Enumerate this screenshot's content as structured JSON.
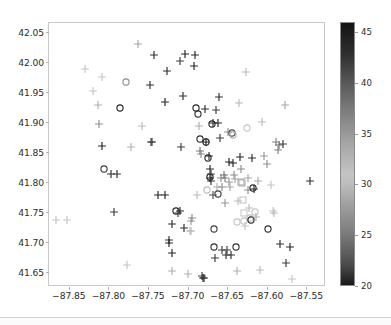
{
  "chart_data": {
    "type": "scatter",
    "title": "",
    "xlabel": "",
    "ylabel": "",
    "xlim": [
      -87.875,
      -87.525
    ],
    "ylim": [
      41.625,
      42.065
    ],
    "xticks": [
      -87.85,
      -87.8,
      -87.75,
      -87.7,
      -87.65,
      -87.6,
      -87.55
    ],
    "xticklabels": [
      "−87.85",
      "−87.80",
      "−87.75",
      "−87.70",
      "−87.65",
      "−87.60",
      "−87.55"
    ],
    "yticks": [
      41.65,
      41.7,
      41.75,
      41.8,
      41.85,
      41.9,
      41.95,
      42.0,
      42.05
    ],
    "yticklabels": [
      "41.65",
      "41.70",
      "41.75",
      "41.80",
      "41.85",
      "41.90",
      "41.95",
      "42.00",
      "42.05"
    ],
    "grid": false,
    "legend": null,
    "colorbar": {
      "position": "right",
      "orientation": "vertical",
      "vmin": 20,
      "vmax": 46,
      "ticks": [
        20,
        25,
        30,
        35,
        40,
        45
      ],
      "ticklabels": [
        "20",
        "25",
        "30",
        "35",
        "40",
        "45"
      ],
      "colormap": "gray-dark-light-dark",
      "stops": [
        {
          "value": 46,
          "color": "#141414"
        },
        {
          "value": 43,
          "color": "#2e2e2e"
        },
        {
          "value": 40,
          "color": "#595959"
        },
        {
          "value": 37,
          "color": "#808080"
        },
        {
          "value": 34,
          "color": "#a6a6a6"
        },
        {
          "value": 31,
          "color": "#c4c4c4"
        },
        {
          "value": 30,
          "color": "#bdbdbd"
        },
        {
          "value": 28,
          "color": "#a0a0a0"
        },
        {
          "value": 25,
          "color": "#7a7a7a"
        },
        {
          "value": 22,
          "color": "#4a4a4a"
        },
        {
          "value": 20,
          "color": "#1a1a1a"
        }
      ]
    },
    "markers": [
      "plus",
      "circle",
      "square"
    ],
    "points": [
      {
        "x": -87.866,
        "y": 41.737,
        "c": 31,
        "m": "plus"
      },
      {
        "x": -87.852,
        "y": 41.736,
        "c": 31,
        "m": "plus"
      },
      {
        "x": -87.83,
        "y": 41.988,
        "c": 31,
        "m": "plus"
      },
      {
        "x": -87.82,
        "y": 41.951,
        "c": 31,
        "m": "plus"
      },
      {
        "x": -87.813,
        "y": 41.929,
        "c": 33,
        "m": "plus"
      },
      {
        "x": -87.812,
        "y": 41.897,
        "c": 36,
        "m": "plus"
      },
      {
        "x": -87.808,
        "y": 41.975,
        "c": 31,
        "m": "plus"
      },
      {
        "x": -87.808,
        "y": 41.86,
        "c": 44,
        "m": "plus"
      },
      {
        "x": -87.806,
        "y": 41.821,
        "c": 42,
        "m": "circle"
      },
      {
        "x": -87.797,
        "y": 41.813,
        "c": 43,
        "m": "plus"
      },
      {
        "x": -87.793,
        "y": 41.75,
        "c": 42,
        "m": "plus"
      },
      {
        "x": -87.789,
        "y": 41.814,
        "c": 43,
        "m": "plus"
      },
      {
        "x": -87.785,
        "y": 41.924,
        "c": 44,
        "m": "circle"
      },
      {
        "x": -87.778,
        "y": 41.967,
        "c": 36,
        "m": "circle"
      },
      {
        "x": -87.777,
        "y": 41.662,
        "c": 31,
        "m": "plus"
      },
      {
        "x": -87.771,
        "y": 41.858,
        "c": 33,
        "m": "plus"
      },
      {
        "x": -87.762,
        "y": 42.03,
        "c": 34,
        "m": "plus"
      },
      {
        "x": -87.757,
        "y": 41.894,
        "c": 32,
        "m": "plus"
      },
      {
        "x": -87.748,
        "y": 41.961,
        "c": 43,
        "m": "plus"
      },
      {
        "x": -87.746,
        "y": 41.867,
        "c": 42,
        "m": "plus"
      },
      {
        "x": -87.745,
        "y": 41.866,
        "c": 42,
        "m": "plus"
      },
      {
        "x": -87.742,
        "y": 42.011,
        "c": 43,
        "m": "plus"
      },
      {
        "x": -87.737,
        "y": 41.778,
        "c": 44,
        "m": "plus"
      },
      {
        "x": -87.729,
        "y": 41.778,
        "c": 44,
        "m": "plus"
      },
      {
        "x": -87.728,
        "y": 41.934,
        "c": 44,
        "m": "plus"
      },
      {
        "x": -87.726,
        "y": 41.985,
        "c": 43,
        "m": "plus"
      },
      {
        "x": -87.724,
        "y": 41.704,
        "c": 43,
        "m": "plus"
      },
      {
        "x": -87.723,
        "y": 41.698,
        "c": 44,
        "m": "plus"
      },
      {
        "x": -87.72,
        "y": 41.73,
        "c": 43,
        "m": "plus"
      },
      {
        "x": -87.719,
        "y": 41.681,
        "c": 44,
        "m": "plus"
      },
      {
        "x": -87.719,
        "y": 41.651,
        "c": 33,
        "m": "plus"
      },
      {
        "x": -87.715,
        "y": 41.751,
        "c": 44,
        "m": "circle"
      },
      {
        "x": -87.712,
        "y": 41.748,
        "c": 42,
        "m": "plus"
      },
      {
        "x": -87.71,
        "y": 42.002,
        "c": 42,
        "m": "plus"
      },
      {
        "x": -87.709,
        "y": 41.751,
        "c": 44,
        "m": "plus"
      },
      {
        "x": -87.708,
        "y": 41.859,
        "c": 42,
        "m": "plus"
      },
      {
        "x": -87.706,
        "y": 41.944,
        "c": 43,
        "m": "plus"
      },
      {
        "x": -87.704,
        "y": 41.723,
        "c": 43,
        "m": "plus"
      },
      {
        "x": -87.703,
        "y": 42.013,
        "c": 44,
        "m": "plus"
      },
      {
        "x": -87.7,
        "y": 41.646,
        "c": 33,
        "m": "plus"
      },
      {
        "x": -87.697,
        "y": 41.719,
        "c": 32,
        "m": "plus"
      },
      {
        "x": -87.696,
        "y": 41.735,
        "c": 35,
        "m": "plus"
      },
      {
        "x": -87.695,
        "y": 41.719,
        "c": 32,
        "m": "plus"
      },
      {
        "x": -87.694,
        "y": 41.74,
        "c": 36,
        "m": "plus"
      },
      {
        "x": -87.692,
        "y": 41.993,
        "c": 44,
        "m": "plus"
      },
      {
        "x": -87.69,
        "y": 42.012,
        "c": 44,
        "m": "plus"
      },
      {
        "x": -87.689,
        "y": 41.924,
        "c": 44,
        "m": "circle"
      },
      {
        "x": -87.688,
        "y": 41.778,
        "c": 32,
        "m": "plus"
      },
      {
        "x": -87.687,
        "y": 41.913,
        "c": 43,
        "m": "circle"
      },
      {
        "x": -87.686,
        "y": 41.894,
        "c": 33,
        "m": "plus"
      },
      {
        "x": -87.684,
        "y": 41.871,
        "c": 43,
        "m": "circle"
      },
      {
        "x": -87.684,
        "y": 41.851,
        "c": 38,
        "m": "plus"
      },
      {
        "x": -87.683,
        "y": 41.847,
        "c": 36,
        "m": "plus"
      },
      {
        "x": -87.682,
        "y": 41.643,
        "c": 42,
        "m": "plus"
      },
      {
        "x": -87.68,
        "y": 41.64,
        "c": 43,
        "m": "plus"
      },
      {
        "x": -87.679,
        "y": 41.64,
        "c": 43,
        "m": "plus"
      },
      {
        "x": -87.678,
        "y": 41.922,
        "c": 43,
        "m": "plus"
      },
      {
        "x": -87.677,
        "y": 41.867,
        "c": 44,
        "m": "circle"
      },
      {
        "x": -87.676,
        "y": 41.866,
        "c": 44,
        "m": "plus"
      },
      {
        "x": -87.675,
        "y": 41.787,
        "c": 32,
        "m": "circle"
      },
      {
        "x": -87.674,
        "y": 41.84,
        "c": 44,
        "m": "circle"
      },
      {
        "x": -87.673,
        "y": 41.843,
        "c": 43,
        "m": "plus"
      },
      {
        "x": -87.672,
        "y": 41.822,
        "c": 44,
        "m": "plus"
      },
      {
        "x": -87.671,
        "y": 41.808,
        "c": 44,
        "m": "circle"
      },
      {
        "x": -87.671,
        "y": 41.806,
        "c": 44,
        "m": "plus"
      },
      {
        "x": -87.67,
        "y": 41.814,
        "c": 42,
        "m": "plus"
      },
      {
        "x": -87.67,
        "y": 41.801,
        "c": 43,
        "m": "plus"
      },
      {
        "x": -87.669,
        "y": 41.897,
        "c": 44,
        "m": "circle"
      },
      {
        "x": -87.668,
        "y": 41.899,
        "c": 43,
        "m": "plus"
      },
      {
        "x": -87.668,
        "y": 41.779,
        "c": 41,
        "m": "plus"
      },
      {
        "x": -87.667,
        "y": 41.721,
        "c": 42,
        "m": "circle"
      },
      {
        "x": -87.666,
        "y": 41.692,
        "c": 43,
        "m": "circle"
      },
      {
        "x": -87.665,
        "y": 41.674,
        "c": 42,
        "m": "plus"
      },
      {
        "x": -87.664,
        "y": 41.92,
        "c": 42,
        "m": "plus"
      },
      {
        "x": -87.663,
        "y": 41.791,
        "c": 33,
        "m": "plus"
      },
      {
        "x": -87.662,
        "y": 41.78,
        "c": 42,
        "m": "circle"
      },
      {
        "x": -87.661,
        "y": 41.899,
        "c": 44,
        "m": "plus"
      },
      {
        "x": -87.66,
        "y": 41.941,
        "c": 43,
        "m": "plus"
      },
      {
        "x": -87.659,
        "y": 41.873,
        "c": 42,
        "m": "plus"
      },
      {
        "x": -87.658,
        "y": 41.806,
        "c": 36,
        "m": "plus"
      },
      {
        "x": -87.657,
        "y": 41.792,
        "c": 36,
        "m": "plus"
      },
      {
        "x": -87.656,
        "y": 41.686,
        "c": 42,
        "m": "plus"
      },
      {
        "x": -87.654,
        "y": 41.812,
        "c": 38,
        "m": "plus"
      },
      {
        "x": -87.653,
        "y": 41.765,
        "c": 35,
        "m": "plus"
      },
      {
        "x": -87.652,
        "y": 41.806,
        "c": 37,
        "m": "plus"
      },
      {
        "x": -87.651,
        "y": 41.679,
        "c": 43,
        "m": "plus"
      },
      {
        "x": -87.65,
        "y": 41.687,
        "c": 42,
        "m": "plus"
      },
      {
        "x": -87.649,
        "y": 41.884,
        "c": 36,
        "m": "plus"
      },
      {
        "x": -87.648,
        "y": 41.8,
        "c": 35,
        "m": "plus"
      },
      {
        "x": -87.647,
        "y": 41.834,
        "c": 44,
        "m": "plus"
      },
      {
        "x": -87.646,
        "y": 41.791,
        "c": 34,
        "m": "plus"
      },
      {
        "x": -87.645,
        "y": 41.678,
        "c": 43,
        "m": "plus"
      },
      {
        "x": -87.644,
        "y": 41.882,
        "c": 41,
        "m": "circle"
      },
      {
        "x": -87.643,
        "y": 41.878,
        "c": 33,
        "m": "circle"
      },
      {
        "x": -87.642,
        "y": 41.831,
        "c": 44,
        "m": "plus"
      },
      {
        "x": -87.641,
        "y": 41.812,
        "c": 36,
        "m": "plus"
      },
      {
        "x": -87.64,
        "y": 41.805,
        "c": 34,
        "m": "plus"
      },
      {
        "x": -87.639,
        "y": 41.692,
        "c": 43,
        "m": "circle"
      },
      {
        "x": -87.638,
        "y": 41.652,
        "c": 33,
        "m": "plus"
      },
      {
        "x": -87.637,
        "y": 41.734,
        "c": 31,
        "m": "circle"
      },
      {
        "x": -87.636,
        "y": 41.769,
        "c": 32,
        "m": "plus"
      },
      {
        "x": -87.635,
        "y": 41.932,
        "c": 32,
        "m": "plus"
      },
      {
        "x": -87.634,
        "y": 41.841,
        "c": 44,
        "m": "plus"
      },
      {
        "x": -87.633,
        "y": 41.822,
        "c": 36,
        "m": "plus"
      },
      {
        "x": -87.632,
        "y": 41.8,
        "c": 34,
        "m": "square"
      },
      {
        "x": -87.631,
        "y": 41.798,
        "c": 33,
        "m": "square"
      },
      {
        "x": -87.63,
        "y": 41.77,
        "c": 31,
        "m": "square"
      },
      {
        "x": -87.629,
        "y": 41.749,
        "c": 31,
        "m": "square"
      },
      {
        "x": -87.628,
        "y": 41.735,
        "c": 31,
        "m": "circle"
      },
      {
        "x": -87.627,
        "y": 41.727,
        "c": 31,
        "m": "plus"
      },
      {
        "x": -87.626,
        "y": 41.983,
        "c": 32,
        "m": "plus"
      },
      {
        "x": -87.625,
        "y": 41.89,
        "c": 31,
        "m": "circle"
      },
      {
        "x": -87.624,
        "y": 41.807,
        "c": 34,
        "m": "plus"
      },
      {
        "x": -87.623,
        "y": 41.786,
        "c": 36,
        "m": "plus"
      },
      {
        "x": -87.622,
        "y": 41.756,
        "c": 32,
        "m": "plus"
      },
      {
        "x": -87.621,
        "y": 41.74,
        "c": 31,
        "m": "circle"
      },
      {
        "x": -87.62,
        "y": 41.736,
        "c": 44,
        "m": "circle"
      },
      {
        "x": -87.618,
        "y": 41.84,
        "c": 43,
        "m": "plus"
      },
      {
        "x": -87.617,
        "y": 41.79,
        "c": 43,
        "m": "circle"
      },
      {
        "x": -87.616,
        "y": 41.789,
        "c": 43,
        "m": "plus"
      },
      {
        "x": -87.615,
        "y": 41.75,
        "c": 31,
        "m": "circle"
      },
      {
        "x": -87.613,
        "y": 41.742,
        "c": 33,
        "m": "plus"
      },
      {
        "x": -87.611,
        "y": 41.801,
        "c": 34,
        "m": "plus"
      },
      {
        "x": -87.609,
        "y": 41.654,
        "c": 30,
        "m": "plus"
      },
      {
        "x": -87.606,
        "y": 41.9,
        "c": 32,
        "m": "plus"
      },
      {
        "x": -87.603,
        "y": 41.844,
        "c": 35,
        "m": "plus"
      },
      {
        "x": -87.6,
        "y": 41.83,
        "c": 36,
        "m": "plus"
      },
      {
        "x": -87.598,
        "y": 41.722,
        "c": 43,
        "m": "circle"
      },
      {
        "x": -87.594,
        "y": 41.795,
        "c": 31,
        "m": "plus"
      },
      {
        "x": -87.592,
        "y": 41.751,
        "c": 31,
        "m": "plus"
      },
      {
        "x": -87.591,
        "y": 41.749,
        "c": 32,
        "m": "plus"
      },
      {
        "x": -87.588,
        "y": 41.866,
        "c": 37,
        "m": "plus"
      },
      {
        "x": -87.586,
        "y": 41.853,
        "c": 37,
        "m": "plus"
      },
      {
        "x": -87.585,
        "y": 41.862,
        "c": 38,
        "m": "plus"
      },
      {
        "x": -87.583,
        "y": 41.696,
        "c": 43,
        "m": "plus"
      },
      {
        "x": -87.579,
        "y": 41.864,
        "c": 42,
        "m": "plus"
      },
      {
        "x": -87.577,
        "y": 41.929,
        "c": 34,
        "m": "plus"
      },
      {
        "x": -87.575,
        "y": 41.665,
        "c": 42,
        "m": "plus"
      },
      {
        "x": -87.571,
        "y": 41.691,
        "c": 44,
        "m": "plus"
      },
      {
        "x": -87.568,
        "y": 41.639,
        "c": 31,
        "m": "plus"
      },
      {
        "x": -87.545,
        "y": 41.801,
        "c": 43,
        "m": "plus"
      }
    ]
  }
}
